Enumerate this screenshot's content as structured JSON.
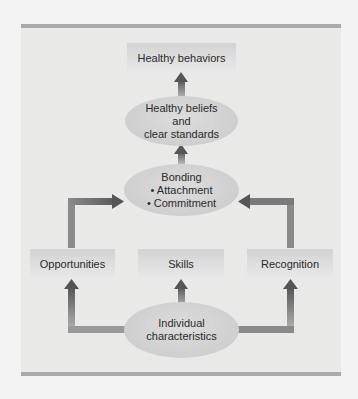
{
  "diagram": {
    "nodes": {
      "healthy_behaviors": "Healthy behaviors",
      "healthy_beliefs": {
        "line1": "Healthy beliefs",
        "line2": "and",
        "line3": "clear standards"
      },
      "bonding": {
        "title": "Bonding",
        "item1": "• Attachment",
        "item2": "• Commitment"
      },
      "opportunities": "Opportunities",
      "skills": "Skills",
      "recognition": "Recognition",
      "individual": {
        "line1": "Individual",
        "line2": "characteristics"
      }
    },
    "edges": [
      {
        "from": "individual",
        "to": "opportunities"
      },
      {
        "from": "individual",
        "to": "skills"
      },
      {
        "from": "individual",
        "to": "recognition"
      },
      {
        "from": "opportunities",
        "to": "bonding"
      },
      {
        "from": "recognition",
        "to": "bonding"
      },
      {
        "from": "bonding",
        "to": "healthy_beliefs"
      },
      {
        "from": "healthy_beliefs",
        "to": "healthy_behaviors"
      }
    ],
    "colors": {
      "arrow": "#6f6f70",
      "panel": "#e9e9e8",
      "rule": "#a9aaa9"
    }
  }
}
